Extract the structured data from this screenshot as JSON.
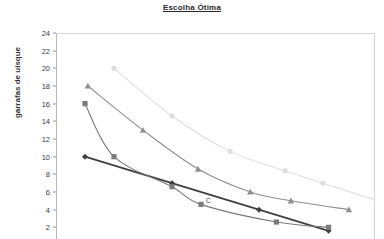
{
  "chart_data": {
    "type": "line",
    "title": "Escolha Ótima",
    "xlabel": "",
    "ylabel": "garrafas de uísque",
    "ylim": [
      0,
      24
    ],
    "y_ticks": [
      2,
      4,
      6,
      8,
      10,
      12,
      14,
      16,
      18,
      20,
      22,
      24
    ],
    "xlim": [
      0,
      11
    ],
    "grid": false,
    "legend": "none",
    "note": "Bottom of figure is cropped: no x-axis tick labels or legend visible.",
    "annotations": [
      {
        "text": "C",
        "x": 5,
        "y": 4.6,
        "series": "curva de indiferença 2"
      }
    ],
    "series": [
      {
        "name": "curva de indiferença 1",
        "marker": "diamond",
        "color": "#3f3f3f",
        "x": [
          1,
          4,
          7,
          9.4
        ],
        "values": [
          10,
          7,
          4,
          1.6
        ]
      },
      {
        "name": "curva de indiferença 2",
        "marker": "square",
        "color": "#7b7b7b",
        "x": [
          1,
          2,
          4,
          5,
          7.6,
          9.4
        ],
        "values": [
          16,
          10,
          6.6,
          4.6,
          2.6,
          2
        ]
      },
      {
        "name": "curva de indiferença 3",
        "marker": "triangle",
        "color": "#8f8f8f",
        "x": [
          1.1,
          3,
          4.9,
          6.7,
          8.1,
          10.1
        ],
        "values": [
          18,
          13,
          8.6,
          6,
          5,
          4
        ]
      },
      {
        "name": "curva de indiferença 4",
        "marker": "circle",
        "color": "#dedede",
        "x": [
          2,
          4,
          6,
          7.9,
          9.2,
          11.1
        ],
        "values": [
          20,
          14.6,
          10.6,
          8.4,
          7,
          5
        ]
      }
    ]
  }
}
